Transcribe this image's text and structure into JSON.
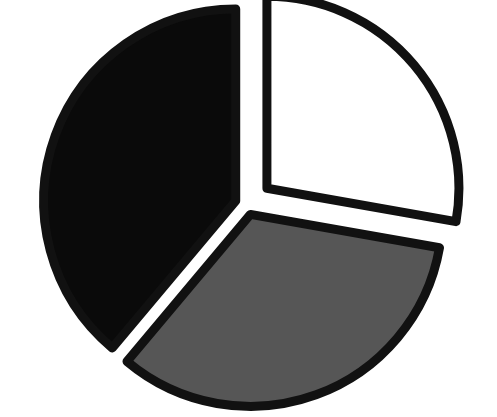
{
  "figure": {
    "title": "",
    "background_color": "#ffffff",
    "width": 497,
    "height": 417
  },
  "chart_data": {
    "type": "pie",
    "title": "",
    "subtitle": "",
    "xlabel": "",
    "ylabel": "",
    "grid": false,
    "legend_position": "none",
    "exploded": true,
    "start_angle_deg": 90,
    "direction": "counterclockwise",
    "center": {
      "x": 247,
      "y": 205
    },
    "radius": 192,
    "outline_color": "#111111",
    "outline_width": 9,
    "labels": [
      "Slice 1",
      "Slice 2",
      "Slice 3"
    ],
    "values": [
      38.9,
      27.8,
      33.3
    ],
    "angles_deg": [
      140,
      100,
      120
    ],
    "colors": [
      "#0a0a0a",
      "#ffffff",
      "#565656"
    ],
    "slices": [
      {
        "name": "black-slice",
        "label": "Slice 1",
        "value": 38.9,
        "angle_deg": 140,
        "start_angle_deg": 90,
        "end_angle_deg": 230,
        "fill": "#0a0a0a",
        "stroke": "#111111",
        "explode_offset": 12,
        "explode_direction_deg": 160
      },
      {
        "name": "white-slice",
        "label": "Slice 2",
        "value": 27.8,
        "angle_deg": 100,
        "start_angle_deg": -10,
        "end_angle_deg": 90,
        "fill": "#ffffff",
        "stroke": "#111111",
        "explode_offset": 26,
        "explode_direction_deg": 40
      },
      {
        "name": "gray-slice",
        "label": "Slice 3",
        "value": 33.3,
        "angle_deg": 120,
        "start_angle_deg": 230,
        "end_angle_deg": 350,
        "fill": "#565656",
        "stroke": "#111111",
        "explode_offset": 10,
        "explode_direction_deg": 290
      }
    ]
  }
}
